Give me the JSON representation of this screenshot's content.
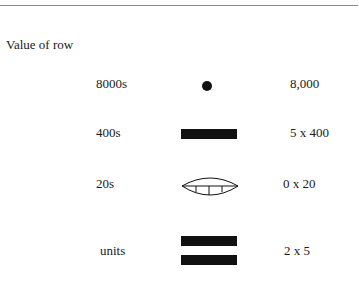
{
  "heading": "Value of row",
  "rows": [
    {
      "label": "8000s",
      "symbol": "dot",
      "value": "8,000"
    },
    {
      "label": "400s",
      "symbol": "one-bar",
      "value": "5 x 400"
    },
    {
      "label": "20s",
      "symbol": "shell",
      "value": "0 x 20"
    },
    {
      "label": "units",
      "symbol": "two-bars",
      "value": "2 x 5"
    }
  ]
}
